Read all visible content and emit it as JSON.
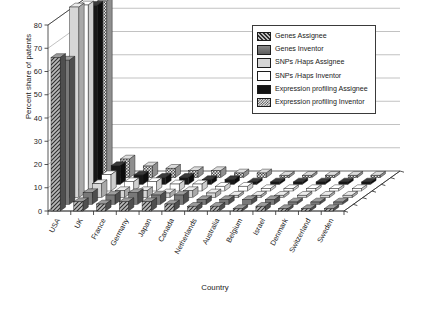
{
  "chart_data": {
    "type": "bar",
    "subtype": "grouped-3d-bar",
    "title": "",
    "xlabel": "Country",
    "ylabel": "Percent share of patents",
    "ylim": [
      0,
      80
    ],
    "yticks": [
      0,
      10,
      20,
      30,
      40,
      50,
      60,
      70,
      80
    ],
    "ytick_labels": [
      "0",
      "10",
      "20",
      "30",
      "40",
      "50",
      "60",
      "70",
      "80"
    ],
    "grid": true,
    "legend_position": "top-right-inside",
    "categories": [
      "USA",
      "UK",
      "France",
      "Germany",
      "Japan",
      "Canada",
      "Netherlands",
      "Australia",
      "Belgium",
      "Israel",
      "Denmark",
      "Switzerland",
      "Sweden"
    ],
    "series": [
      {
        "name": "Genes Assignee",
        "values": [
          66,
          4,
          3,
          4,
          4,
          3,
          2,
          2,
          1,
          2,
          1,
          1,
          1
        ]
      },
      {
        "name": "Genes Inventor",
        "values": [
          62,
          5,
          4,
          5,
          4,
          4,
          2,
          2,
          2,
          2,
          1,
          1,
          1
        ]
      },
      {
        "name": "SNPs /Haps Assignee",
        "values": [
          82,
          6,
          3,
          3,
          2,
          3,
          2,
          1,
          1,
          1,
          1,
          1,
          1
        ]
      },
      {
        "name": "SNPs /Haps Inventor",
        "values": [
          80,
          7,
          4,
          4,
          3,
          3,
          2,
          2,
          1,
          1,
          1,
          1,
          1
        ]
      },
      {
        "name": "Expression profiling Assignee",
        "values": [
          77,
          8,
          4,
          3,
          3,
          2,
          2,
          1,
          1,
          1,
          1,
          1,
          1
        ]
      },
      {
        "name": "Expression profiling Inventor",
        "values": [
          76,
          8,
          5,
          4,
          3,
          3,
          2,
          2,
          1,
          1,
          1,
          1,
          1
        ]
      }
    ]
  },
  "axes": {
    "y_title": "Percent share of patents",
    "x_title": "Country",
    "y_ticks": [
      "0",
      "10",
      "20",
      "30",
      "40",
      "50",
      "60",
      "70",
      "80"
    ],
    "x_tick_labels": [
      "USA",
      "UK",
      "France",
      "Germany",
      "Japan",
      "Canada",
      "Netherlands",
      "Australia",
      "Belgium",
      "Israel",
      "Denmark",
      "Switzerland",
      "Sweden"
    ]
  },
  "legend": {
    "items": [
      {
        "label": "Genes Assignee",
        "pattern": "diagonal-hatch-dark",
        "color": "#3a3a3a"
      },
      {
        "label": "Genes Inventor",
        "pattern": "solid-grey",
        "color": "#6e6e6e"
      },
      {
        "label": "SNPs /Haps Assignee",
        "pattern": "light-grey",
        "color": "#d2d2d2"
      },
      {
        "label": "SNPs /Haps Inventor",
        "pattern": "white",
        "color": "#ffffff"
      },
      {
        "label": "Expression profiling Assignee",
        "pattern": "solid-black",
        "color": "#151515"
      },
      {
        "label": "Expression profiling Inventor",
        "pattern": "checker",
        "color": "#b9b9b9"
      }
    ]
  }
}
